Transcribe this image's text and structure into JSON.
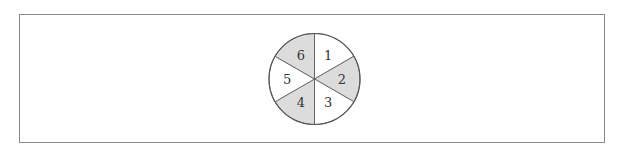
{
  "diagram": {
    "type": "spinner",
    "center": [
      314.5,
      79
    ],
    "radius": 45.5,
    "colors": {
      "shaded": "#dcdcdc",
      "unshaded": "#ffffff",
      "stroke": "#555555",
      "frame": "#8a8a8a"
    },
    "sectors": [
      {
        "label": "1",
        "shaded": false,
        "start_deg": -90,
        "end_deg": -30
      },
      {
        "label": "2",
        "shaded": true,
        "start_deg": -30,
        "end_deg": 30
      },
      {
        "label": "3",
        "shaded": false,
        "start_deg": 30,
        "end_deg": 90
      },
      {
        "label": "4",
        "shaded": true,
        "start_deg": 90,
        "end_deg": 150
      },
      {
        "label": "5",
        "shaded": false,
        "start_deg": 150,
        "end_deg": 210
      },
      {
        "label": "6",
        "shaded": true,
        "start_deg": 210,
        "end_deg": 270
      }
    ]
  }
}
